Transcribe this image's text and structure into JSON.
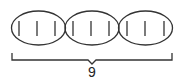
{
  "diagram": {
    "groups": [
      {
        "tallies": 3
      },
      {
        "tallies": 3
      },
      {
        "tallies": 3
      }
    ],
    "bracket_label": "9",
    "stroke_color": "#333333"
  }
}
